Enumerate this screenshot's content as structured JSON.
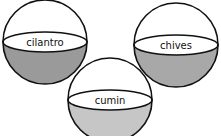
{
  "diagram": {
    "type": "hemisphere-bowls",
    "bowls": [
      {
        "label": "cilantro",
        "fill": "#9a9a9a",
        "cx": 45,
        "cy": 43,
        "r": 42
      },
      {
        "label": "chives",
        "fill": "#a8a8a8",
        "cx": 176,
        "cy": 46,
        "r": 42
      },
      {
        "label": "cumin",
        "fill": "#c6c6c6",
        "cx": 110,
        "cy": 92,
        "r": 42
      }
    ]
  }
}
